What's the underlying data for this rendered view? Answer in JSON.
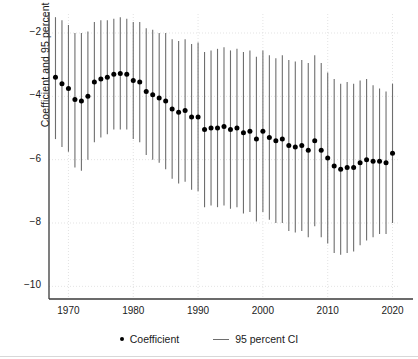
{
  "chart_data": {
    "type": "scatter",
    "title": "",
    "subtitle": "",
    "xlabel": "",
    "ylabel": "Coefficient and 95 percent CI",
    "xlim": [
      1967.0,
      2021.0
    ],
    "ylim": [
      -10.4,
      -1.4
    ],
    "xticks": [
      1970,
      1980,
      1990,
      2000,
      2010,
      2020
    ],
    "yticks": [
      -2,
      -4,
      -6,
      -8,
      -10
    ],
    "ytick_labels": [
      "−2",
      "−4",
      "−6",
      "−8",
      "−10"
    ],
    "xtick_labels": [
      "1970",
      "1980",
      "1990",
      "2000",
      "2010",
      "2020"
    ],
    "grid": true,
    "legend_position": "bottom",
    "marker_color": "#000000",
    "errorbar_color": "#6e6e6e",
    "grid_color": "#dcdcdc",
    "axis_color": "#3a3a3a",
    "legend": [
      {
        "label": "Coefficient",
        "marker": "dot",
        "color": "#000000"
      },
      {
        "label": "95 percent CI",
        "marker": "line",
        "color": "#6e6e6e"
      }
    ],
    "x": [
      1968,
      1969,
      1970,
      1971,
      1972,
      1973,
      1974,
      1975,
      1976,
      1977,
      1978,
      1979,
      1980,
      1981,
      1982,
      1983,
      1984,
      1985,
      1986,
      1987,
      1988,
      1989,
      1990,
      1991,
      1992,
      1993,
      1994,
      1995,
      1996,
      1997,
      1998,
      1999,
      2000,
      2001,
      2002,
      2003,
      2004,
      2005,
      2006,
      2007,
      2008,
      2009,
      2010,
      2011,
      2012,
      2013,
      2014,
      2015,
      2016,
      2017,
      2018,
      2019,
      2020
    ],
    "values": [
      -3.4,
      -3.6,
      -3.75,
      -4.1,
      -4.15,
      -4.0,
      -3.55,
      -3.45,
      -3.4,
      -3.3,
      -3.28,
      -3.3,
      -3.5,
      -3.55,
      -3.85,
      -3.95,
      -4.05,
      -4.15,
      -4.4,
      -4.5,
      -4.45,
      -4.65,
      -4.65,
      -5.05,
      -5.0,
      -5.0,
      -4.95,
      -5.05,
      -5.0,
      -5.15,
      -5.1,
      -5.35,
      -5.1,
      -5.3,
      -5.4,
      -5.35,
      -5.55,
      -5.6,
      -5.55,
      -5.7,
      -5.4,
      -5.7,
      -5.95,
      -6.2,
      -6.3,
      -6.25,
      -6.25,
      -6.1,
      -6.0,
      -6.05,
      -6.05,
      -6.1,
      -5.8
    ],
    "ci_low": [
      -5.35,
      -5.6,
      -5.75,
      -6.25,
      -6.35,
      -6.0,
      -5.45,
      -5.3,
      -5.2,
      -5.05,
      -5.05,
      -5.05,
      -5.35,
      -5.45,
      -5.85,
      -6.0,
      -6.1,
      -6.3,
      -6.6,
      -6.75,
      -6.7,
      -6.95,
      -7.0,
      -7.5,
      -7.45,
      -7.5,
      -7.45,
      -7.55,
      -7.5,
      -7.7,
      -7.65,
      -7.95,
      -7.65,
      -7.9,
      -8.0,
      -8.0,
      -8.25,
      -8.3,
      -8.25,
      -8.45,
      -8.1,
      -8.45,
      -8.65,
      -8.95,
      -9.0,
      -8.95,
      -8.9,
      -8.7,
      -8.55,
      -8.45,
      -8.35,
      -8.35,
      -8.0
    ],
    "ci_high": [
      -1.5,
      -1.6,
      -1.75,
      -2.0,
      -2.0,
      -1.95,
      -1.65,
      -1.6,
      -1.6,
      -1.55,
      -1.5,
      -1.55,
      -1.65,
      -1.65,
      -1.85,
      -1.9,
      -2.0,
      -2.0,
      -2.2,
      -2.25,
      -2.2,
      -2.35,
      -2.3,
      -2.6,
      -2.55,
      -2.5,
      -2.45,
      -2.55,
      -2.5,
      -2.6,
      -2.55,
      -2.75,
      -2.55,
      -2.7,
      -2.8,
      -2.7,
      -2.85,
      -2.9,
      -2.85,
      -2.95,
      -2.7,
      -2.95,
      -3.25,
      -3.45,
      -3.6,
      -3.55,
      -3.6,
      -3.5,
      -3.45,
      -3.65,
      -3.75,
      -3.85,
      -3.6
    ]
  }
}
